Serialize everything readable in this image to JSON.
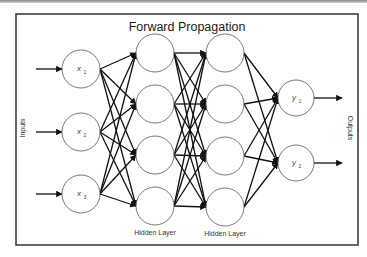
{
  "diagram": {
    "title": "Forward Propagation",
    "side_labels": {
      "left": "Inputs",
      "right": "Outputs"
    },
    "layers": [
      {
        "name": "input",
        "caption": "",
        "x": 81,
        "r": 19,
        "nodes": [
          {
            "label": "x",
            "sub": "1",
            "y": 69
          },
          {
            "label": "x",
            "sub": "2",
            "y": 132
          },
          {
            "label": "x",
            "sub": "3",
            "y": 194
          }
        ]
      },
      {
        "name": "hidden1",
        "caption": "Hidden Layer",
        "x": 155,
        "r": 19,
        "nodes": [
          {
            "y": 53
          },
          {
            "y": 104
          },
          {
            "y": 155
          },
          {
            "y": 206
          }
        ]
      },
      {
        "name": "hidden2",
        "caption": "Hidden Layer",
        "x": 225,
        "r": 19,
        "nodes": [
          {
            "y": 53
          },
          {
            "y": 104
          },
          {
            "y": 156
          },
          {
            "y": 207
          }
        ]
      },
      {
        "name": "output",
        "caption": "",
        "x": 296,
        "r": 18,
        "nodes": [
          {
            "label": "y",
            "sub": "1",
            "y": 98
          },
          {
            "label": "y",
            "sub": "2",
            "y": 163
          }
        ]
      }
    ],
    "connections": "fully-connected between adjacent layers",
    "colors": {
      "edge": "#111111",
      "node_stroke": "#555555",
      "frame": "#333333"
    }
  }
}
